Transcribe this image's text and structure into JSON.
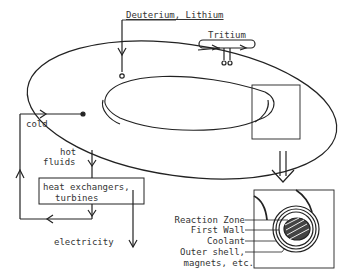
{
  "diagram": {
    "inputs": {
      "fuel_label": "Deuterium, Lithium",
      "tritium_label": "Tritium"
    },
    "flows": {
      "cold_label": "cold",
      "hot_label_line1": "hot",
      "hot_label_line2": "fluids",
      "electricity_label": "electricity"
    },
    "boxes": {
      "heat_exchanger_line1": "heat exchangers,",
      "heat_exchanger_line2": "turbines"
    },
    "cross_section": {
      "labels": [
        "Reaction Zone",
        "First Wall",
        "Coolant",
        "Outer shell,",
        "magnets, etc."
      ]
    }
  }
}
